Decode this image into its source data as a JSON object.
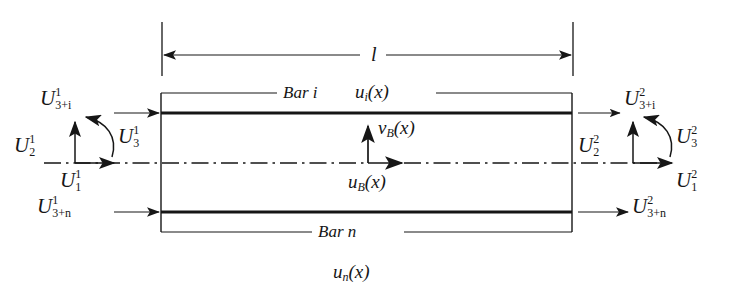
{
  "figure": {
    "type": "structural-engineering-diagram",
    "background": "#ffffff",
    "line_color": "#161616"
  },
  "dimension": {
    "name": "length-dimension",
    "label": "l",
    "arrow_style": "double-headed",
    "extension_lines": 2
  },
  "frame": {
    "left_edge_x": 161,
    "right_edge_x": 572,
    "top_thin_y": 93,
    "top_bar_y": 113,
    "bottom_bar_y": 212,
    "bottom_thin_y": 232,
    "centerline_y": 163,
    "centerline_style": "dash-dot"
  },
  "bars": {
    "top_label": "Bar i",
    "top_function": "u",
    "top_function_sub": "i",
    "top_function_arg": "(x)",
    "bottom_label": "Bar n"
  },
  "center_fields": {
    "vertical": {
      "base": "v",
      "sub": "B",
      "arg": "(x)"
    },
    "horizontal": {
      "base": "u",
      "sub": "B",
      "arg": "(x)"
    }
  },
  "caption": {
    "base": "u",
    "sub": "n",
    "arg": "(x)"
  },
  "dofs": {
    "left": [
      {
        "name": "dof-left-axial-top",
        "base": "U",
        "sup": "1",
        "sub": "3+i",
        "arrow": "right"
      },
      {
        "name": "dof-left-vertical",
        "base": "U",
        "sup": "1",
        "sub": "2",
        "arrow": "up"
      },
      {
        "name": "dof-left-rotation",
        "base": "U",
        "sup": "1",
        "sub": "3",
        "arrow": "curved"
      },
      {
        "name": "dof-left-horizontal",
        "base": "U",
        "sup": "1",
        "sub": "1",
        "arrow": "right"
      },
      {
        "name": "dof-left-axial-bottom",
        "base": "U",
        "sup": "1",
        "sub": "3+n",
        "arrow": "right"
      }
    ],
    "right": [
      {
        "name": "dof-right-axial-top",
        "base": "U",
        "sup": "2",
        "sub": "3+i",
        "arrow": "right"
      },
      {
        "name": "dof-right-vertical",
        "base": "U",
        "sup": "2",
        "sub": "2",
        "arrow": "up"
      },
      {
        "name": "dof-right-rotation",
        "base": "U",
        "sup": "2",
        "sub": "3",
        "arrow": "curved"
      },
      {
        "name": "dof-right-horizontal",
        "base": "U",
        "sup": "2",
        "sub": "1",
        "arrow": "right"
      },
      {
        "name": "dof-right-axial-bottom",
        "base": "U",
        "sup": "2",
        "sub": "3+n",
        "arrow": "right"
      }
    ]
  }
}
